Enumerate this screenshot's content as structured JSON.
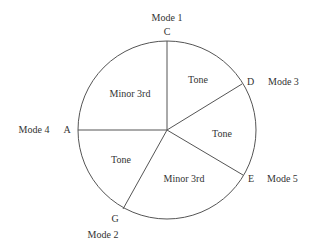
{
  "diagram": {
    "nodes": [
      {
        "note": "C",
        "mode": "Mode 1"
      },
      {
        "note": "D",
        "mode": "Mode 3"
      },
      {
        "note": "E",
        "mode": "Mode 5"
      },
      {
        "note": "G",
        "mode": "Mode 2"
      },
      {
        "note": "A",
        "mode": "Mode 4"
      }
    ],
    "segments": [
      {
        "from": "C",
        "to": "D",
        "interval": "Tone"
      },
      {
        "from": "D",
        "to": "E",
        "interval": "Tone"
      },
      {
        "from": "E",
        "to": "G",
        "interval": "Minor 3rd"
      },
      {
        "from": "G",
        "to": "A",
        "interval": "Tone"
      },
      {
        "from": "A",
        "to": "C",
        "interval": "Minor 3rd"
      }
    ],
    "colors": {
      "line": "#555555",
      "text": "#333333",
      "background": "#ffffff"
    }
  }
}
